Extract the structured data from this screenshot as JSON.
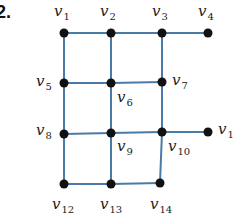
{
  "problem_number": "2.",
  "edge_color": "#4a7aa8",
  "node_color": "#111111",
  "nodes": [
    {
      "id": "v1",
      "x": 64,
      "y": 33,
      "label_base": "v",
      "label_sub": "1",
      "lx": 54,
      "ly": 4
    },
    {
      "id": "v2",
      "x": 111,
      "y": 33,
      "label_base": "v",
      "label_sub": "2",
      "lx": 100,
      "ly": 4
    },
    {
      "id": "v3",
      "x": 162,
      "y": 33,
      "label_base": "v",
      "label_sub": "3",
      "lx": 152,
      "ly": 4
    },
    {
      "id": "v4",
      "x": 208,
      "y": 33,
      "label_base": "v",
      "label_sub": "4",
      "lx": 198,
      "ly": 4
    },
    {
      "id": "v5",
      "x": 64,
      "y": 83,
      "label_base": "v",
      "label_sub": "5",
      "lx": 36,
      "ly": 74
    },
    {
      "id": "v6",
      "x": 111,
      "y": 83,
      "label_base": "v",
      "label_sub": "6",
      "lx": 117,
      "ly": 90
    },
    {
      "id": "v7",
      "x": 162,
      "y": 82,
      "label_base": "v",
      "label_sub": "7",
      "lx": 172,
      "ly": 73
    },
    {
      "id": "v8",
      "x": 64,
      "y": 134,
      "label_base": "v",
      "label_sub": "8",
      "lx": 36,
      "ly": 123
    },
    {
      "id": "v9",
      "x": 111,
      "y": 133,
      "label_base": "v",
      "label_sub": "9",
      "lx": 117,
      "ly": 139
    },
    {
      "id": "v10",
      "x": 162,
      "y": 132,
      "label_base": "v",
      "label_sub": "10",
      "lx": 168,
      "ly": 139
    },
    {
      "id": "v11",
      "x": 208,
      "y": 132,
      "label_base": "v",
      "label_sub": "1",
      "lx": 218,
      "ly": 122
    },
    {
      "id": "v12",
      "x": 64,
      "y": 184,
      "label_base": "v",
      "label_sub": "12",
      "lx": 52,
      "ly": 197
    },
    {
      "id": "v13",
      "x": 111,
      "y": 184,
      "label_base": "v",
      "label_sub": "13",
      "lx": 100,
      "ly": 197
    },
    {
      "id": "v14",
      "x": 160,
      "y": 183,
      "label_base": "v",
      "label_sub": "14",
      "lx": 150,
      "ly": 197
    }
  ],
  "edges": [
    [
      "v1",
      "v2"
    ],
    [
      "v2",
      "v3"
    ],
    [
      "v3",
      "v4"
    ],
    [
      "v1",
      "v5"
    ],
    [
      "v2",
      "v6"
    ],
    [
      "v3",
      "v7"
    ],
    [
      "v5",
      "v6"
    ],
    [
      "v6",
      "v7"
    ],
    [
      "v5",
      "v8"
    ],
    [
      "v6",
      "v9"
    ],
    [
      "v7",
      "v10"
    ],
    [
      "v8",
      "v9"
    ],
    [
      "v9",
      "v10"
    ],
    [
      "v10",
      "v11"
    ],
    [
      "v8",
      "v12"
    ],
    [
      "v9",
      "v13"
    ],
    [
      "v10",
      "v14"
    ],
    [
      "v12",
      "v13"
    ],
    [
      "v13",
      "v14"
    ]
  ]
}
